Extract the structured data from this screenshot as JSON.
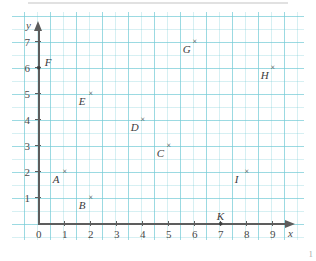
{
  "figure": {
    "kind": "coordinate-plane-scatter",
    "page_number": "1",
    "grid_color": "#78CDD7",
    "axis_color": "#5D5D5D",
    "marker_color": "#3C3C3C"
  },
  "axes": {
    "x_name": "x",
    "y_name": "y",
    "x_ticks": [
      "0",
      "1",
      "2",
      "3",
      "4",
      "5",
      "6",
      "7",
      "8",
      "9"
    ],
    "y_ticks": [
      "1",
      "2",
      "3",
      "4",
      "5",
      "6",
      "7"
    ]
  },
  "chart_data": {
    "type": "scatter",
    "title": "",
    "xlabel": "x",
    "ylabel": "y",
    "xlim": [
      0,
      9.5
    ],
    "ylim": [
      0,
      7.5
    ],
    "grid": true,
    "legend": "none",
    "points": [
      {
        "label": "A",
        "x": 1,
        "y": 2,
        "marker": "x",
        "label_pos": "down-left"
      },
      {
        "label": "B",
        "x": 2,
        "y": 1,
        "marker": "x",
        "label_pos": "down-left"
      },
      {
        "label": "C",
        "x": 5,
        "y": 3,
        "marker": "x",
        "label_pos": "down-left"
      },
      {
        "label": "D",
        "x": 4,
        "y": 4,
        "marker": "x",
        "label_pos": "down-left"
      },
      {
        "label": "E",
        "x": 2,
        "y": 5,
        "marker": "x",
        "label_pos": "down-left"
      },
      {
        "label": "F",
        "x": 0,
        "y": 6,
        "marker": "dot",
        "label_pos": "up-right"
      },
      {
        "label": "G",
        "x": 6,
        "y": 7,
        "marker": "x",
        "label_pos": "down-left"
      },
      {
        "label": "H",
        "x": 9,
        "y": 6,
        "marker": "x",
        "label_pos": "down-left"
      },
      {
        "label": "I",
        "x": 8,
        "y": 2,
        "marker": "x",
        "label_pos": "down-left"
      },
      {
        "label": "K",
        "x": 7,
        "y": 0,
        "marker": "dot",
        "label_pos": "up"
      }
    ]
  }
}
